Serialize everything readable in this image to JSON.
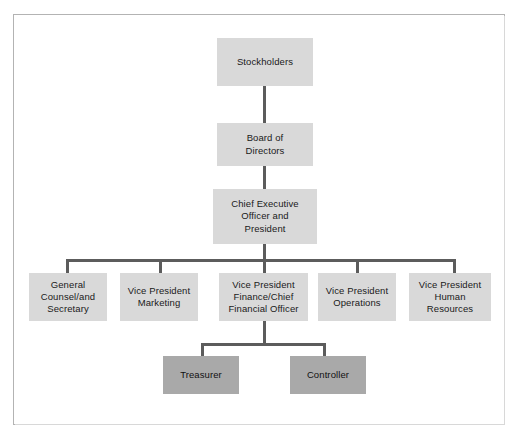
{
  "chart": {
    "type": "org-chart",
    "colors": {
      "node_light": "#d9d9d9",
      "node_shaded": "#a9a9a9",
      "connector": "#5c5c5c",
      "frame_border": "#b3b3b3",
      "background": "#ffffff",
      "text": "#1a1a1a"
    },
    "levels": [
      {
        "level": 1,
        "nodes": [
          {
            "id": "stockholders",
            "label": "Stockholders",
            "style": "light"
          }
        ]
      },
      {
        "level": 2,
        "nodes": [
          {
            "id": "board",
            "label": "Board of\nDirectors",
            "style": "light"
          }
        ]
      },
      {
        "level": 3,
        "nodes": [
          {
            "id": "ceo",
            "label": "Chief Executive\nOfficer and\nPresident",
            "style": "light"
          }
        ]
      },
      {
        "level": 4,
        "nodes": [
          {
            "id": "general_counsel",
            "label": "General\nCounsel/and\nSecretary",
            "style": "light"
          },
          {
            "id": "vp_marketing",
            "label": "Vice President\nMarketing",
            "style": "light"
          },
          {
            "id": "vp_finance",
            "label": "Vice President\nFinance/Chief\nFinancial Officer",
            "style": "light"
          },
          {
            "id": "vp_operations",
            "label": "Vice President\nOperations",
            "style": "light"
          },
          {
            "id": "vp_hr",
            "label": "Vice President\nHuman\nResources",
            "style": "light"
          }
        ]
      },
      {
        "level": 5,
        "nodes": [
          {
            "id": "treasurer",
            "label": "Treasurer",
            "style": "shaded"
          },
          {
            "id": "controller",
            "label": "Controller",
            "style": "shaded"
          }
        ]
      }
    ],
    "edges": [
      {
        "from": "stockholders",
        "to": "board"
      },
      {
        "from": "board",
        "to": "ceo"
      },
      {
        "from": "ceo",
        "to": "general_counsel"
      },
      {
        "from": "ceo",
        "to": "vp_marketing"
      },
      {
        "from": "ceo",
        "to": "vp_finance"
      },
      {
        "from": "ceo",
        "to": "vp_operations"
      },
      {
        "from": "ceo",
        "to": "vp_hr"
      },
      {
        "from": "vp_finance",
        "to": "treasurer"
      },
      {
        "from": "vp_finance",
        "to": "controller"
      }
    ]
  },
  "nodes": {
    "stockholders": "Stockholders",
    "board": "Board of\nDirectors",
    "ceo": "Chief Executive\nOfficer and\nPresident",
    "general_counsel": "General\nCounsel/and\nSecretary",
    "vp_marketing": "Vice President\nMarketing",
    "vp_finance": "Vice President\nFinance/Chief\nFinancial Officer",
    "vp_operations": "Vice President\nOperations",
    "vp_hr": "Vice President\nHuman\nResources",
    "treasurer": "Treasurer",
    "controller": "Controller"
  }
}
